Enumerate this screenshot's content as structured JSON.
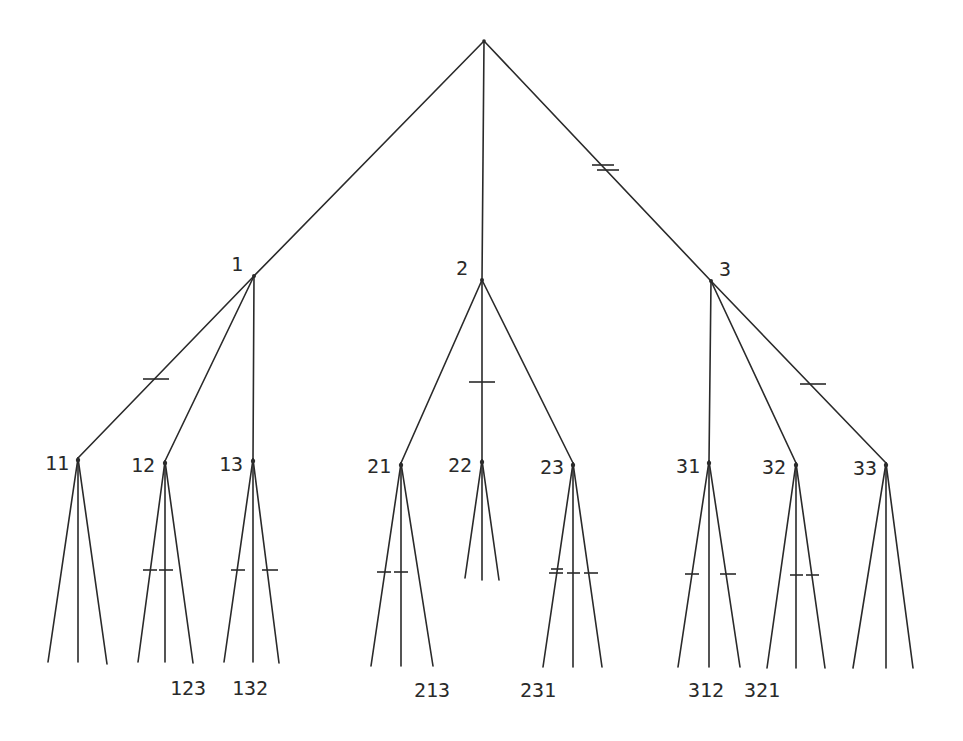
{
  "diagram": {
    "type": "game-tree",
    "ink_color": "#2a2a2a",
    "background": "#ffffff",
    "root": {
      "id": "root",
      "x": 484,
      "y": 41,
      "label": ""
    },
    "level1": [
      {
        "id": "1",
        "label": "1",
        "x": 254,
        "y": 276,
        "label_x": 231,
        "label_y": 254
      },
      {
        "id": "2",
        "label": "2",
        "x": 482,
        "y": 280,
        "label_x": 456,
        "label_y": 258
      },
      {
        "id": "3",
        "label": "3",
        "x": 711,
        "y": 281,
        "label_x": 719,
        "label_y": 259
      }
    ],
    "level2": [
      {
        "id": "11",
        "label": "11",
        "x": 78,
        "y": 458,
        "label_x": 45,
        "label_y": 453
      },
      {
        "id": "12",
        "label": "12",
        "x": 165,
        "y": 461,
        "label_x": 131,
        "label_y": 455
      },
      {
        "id": "13",
        "label": "13",
        "x": 253,
        "y": 459,
        "label_x": 219,
        "label_y": 454
      },
      {
        "id": "21",
        "label": "21",
        "x": 401,
        "y": 463,
        "label_x": 367,
        "label_y": 456
      },
      {
        "id": "22",
        "label": "22",
        "x": 482,
        "y": 460,
        "label_x": 448,
        "label_y": 455
      },
      {
        "id": "23",
        "label": "23",
        "x": 573,
        "y": 463,
        "label_x": 540,
        "label_y": 457
      },
      {
        "id": "31",
        "label": "31",
        "x": 709,
        "y": 461,
        "label_x": 676,
        "label_y": 456
      },
      {
        "id": "32",
        "label": "32",
        "x": 796,
        "y": 463,
        "label_x": 762,
        "label_y": 457
      },
      {
        "id": "33",
        "label": "33",
        "x": 886,
        "y": 463,
        "label_x": 853,
        "label_y": 458
      }
    ],
    "leaf_labels": [
      {
        "text": "123",
        "x": 170,
        "y": 678
      },
      {
        "text": "132",
        "x": 232,
        "y": 678
      },
      {
        "text": "213",
        "x": 414,
        "y": 680
      },
      {
        "text": "231",
        "x": 520,
        "y": 680
      },
      {
        "text": "312",
        "x": 688,
        "y": 680
      },
      {
        "text": "321",
        "x": 744,
        "y": 680
      }
    ],
    "tick_marks": [
      {
        "on_edge": "1-11",
        "count": 1
      },
      {
        "on_edge": "2-22",
        "count": 1
      },
      {
        "on_edge": "root-3",
        "count": 2
      },
      {
        "on_edge": "3-33",
        "count": 1
      },
      {
        "on_edge": "12-left",
        "count": 1
      },
      {
        "on_edge": "12-mid",
        "count": 1
      },
      {
        "on_edge": "13-left",
        "count": 1
      },
      {
        "on_edge": "13-right",
        "count": 1
      },
      {
        "on_edge": "21-left",
        "count": 1
      },
      {
        "on_edge": "21-mid",
        "count": 1
      },
      {
        "on_edge": "23-left",
        "count": 2
      },
      {
        "on_edge": "23-mid",
        "count": 1
      },
      {
        "on_edge": "23-right",
        "count": 1
      },
      {
        "on_edge": "31-left",
        "count": 1
      },
      {
        "on_edge": "31-right",
        "count": 1
      },
      {
        "on_edge": "32-mid",
        "count": 1
      },
      {
        "on_edge": "32-right",
        "count": 1
      }
    ]
  }
}
